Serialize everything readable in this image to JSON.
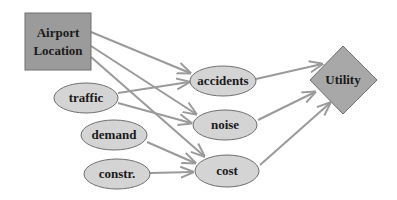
{
  "diagram": {
    "type": "influence-diagram",
    "colors": {
      "node_fill": "#d4d4d4",
      "decision_fill": "#9b9b9b",
      "utility_fill": "#a8a8a8",
      "stroke": "#6e6e6e",
      "edge": "#9a9a9a"
    },
    "nodes": {
      "airport": {
        "label_line1": "Airport",
        "label_line2": "Location",
        "shape": "rectangle"
      },
      "traffic": {
        "label": "traffic",
        "shape": "ellipse"
      },
      "demand": {
        "label": "demand",
        "shape": "ellipse"
      },
      "constr": {
        "label": "constr.",
        "shape": "ellipse"
      },
      "accidents": {
        "label": "accidents",
        "shape": "ellipse"
      },
      "noise": {
        "label": "noise",
        "shape": "ellipse"
      },
      "cost": {
        "label": "cost",
        "shape": "ellipse"
      },
      "utility": {
        "label": "Utility",
        "shape": "diamond"
      }
    },
    "edges": [
      [
        "Airport Location",
        "accidents"
      ],
      [
        "Airport Location",
        "noise"
      ],
      [
        "Airport Location",
        "cost"
      ],
      [
        "traffic",
        "accidents"
      ],
      [
        "traffic",
        "noise"
      ],
      [
        "demand",
        "cost"
      ],
      [
        "constr.",
        "cost"
      ],
      [
        "accidents",
        "Utility"
      ],
      [
        "noise",
        "Utility"
      ],
      [
        "cost",
        "Utility"
      ]
    ]
  }
}
